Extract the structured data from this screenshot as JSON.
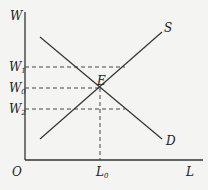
{
  "diagram": {
    "type": "supply-demand",
    "axes": {
      "y_label": "W",
      "x_label": "L",
      "origin": "O"
    },
    "curves": {
      "supply": "S",
      "demand": "D"
    },
    "equilibrium": "E",
    "wage_levels": [
      {
        "base": "W",
        "sub": "1"
      },
      {
        "base": "W",
        "sub": "0"
      },
      {
        "base": "W",
        "sub": "2"
      }
    ],
    "quantity": {
      "base": "L",
      "sub": "0"
    }
  }
}
